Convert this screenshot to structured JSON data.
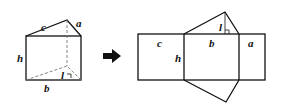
{
  "figure": {
    "prism_labels": {
      "c": "c",
      "a": "a",
      "h": "h",
      "l": "l",
      "b": "b"
    },
    "net_labels": {
      "c": "c",
      "b": "b",
      "a": "a",
      "h": "h",
      "l": "l"
    },
    "arrow": "right-arrow",
    "colors": {
      "stroke": "#111111",
      "hidden": "#777777",
      "background": "#ffffff"
    }
  }
}
